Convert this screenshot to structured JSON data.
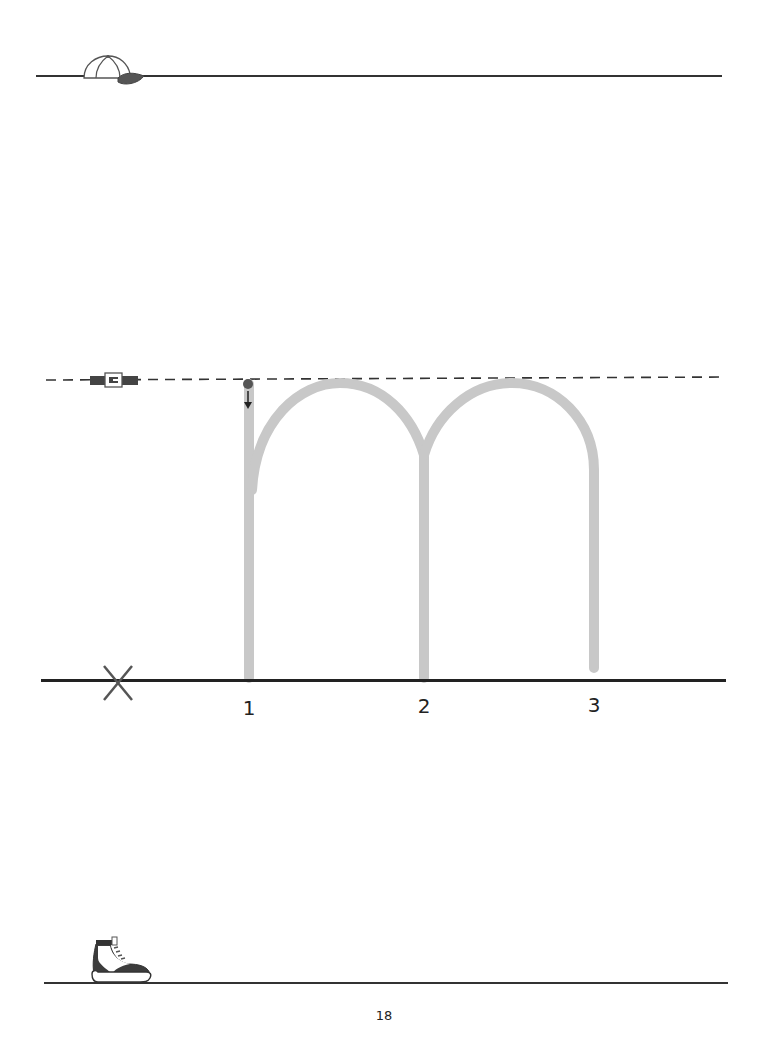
{
  "worksheet": {
    "letter": "m",
    "guide_lines": {
      "top": {
        "icon": "cap-icon",
        "style": "solid"
      },
      "middle": {
        "icon": "belt-icon",
        "style": "dashed"
      },
      "baseline": {
        "icon": "x-mark-icon",
        "style": "solid"
      },
      "bottom": {
        "icon": "shoe-icon",
        "style": "solid"
      }
    },
    "stroke_numbers": [
      "1",
      "2",
      "3"
    ],
    "start_marker": "start-dot-with-down-arrow",
    "colors": {
      "trace_stroke": "#c8c8c8",
      "line": "#333333",
      "start_dot": "#555555"
    }
  },
  "footer": {
    "page_number": "18"
  }
}
